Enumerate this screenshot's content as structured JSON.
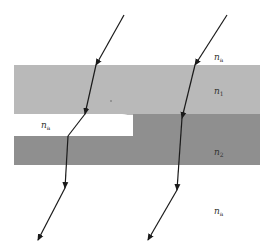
{
  "diagram": {
    "type": "optical-refraction-layers",
    "background": "#ffffff",
    "layers": [
      {
        "name": "layer-n1",
        "label": "n",
        "subscript": "1",
        "color": "#b9b9b9",
        "x": 14,
        "y": 65,
        "width": 246,
        "height": 49
      },
      {
        "name": "layer-n2",
        "label": "n",
        "subscript": "2",
        "color": "#8f8f8f",
        "x": 14,
        "y": 114,
        "width": 246,
        "height": 51
      }
    ],
    "gap": {
      "label": "n",
      "subscript": "a",
      "color": "#ffffff",
      "x": 14,
      "y": 114,
      "width": 119,
      "height": 22,
      "corner_radius": 11
    },
    "media_labels": [
      {
        "name": "label-na-top",
        "text": "n",
        "sub": "a",
        "x": 215,
        "y": 59
      },
      {
        "name": "label-n1",
        "text": "n",
        "sub": "1",
        "x": 215,
        "y": 94
      },
      {
        "name": "label-na-gap",
        "text": "n",
        "sub": "a",
        "x": 42,
        "y": 128
      },
      {
        "name": "label-n2",
        "text": "n",
        "sub": "2",
        "x": 215,
        "y": 154
      },
      {
        "name": "label-na-bottom",
        "text": "n",
        "sub": "a",
        "x": 215,
        "y": 213
      }
    ],
    "rays": [
      {
        "name": "ray-left",
        "color": "#1a1a1a",
        "points": [
          [
            124,
            15
          ],
          [
            96,
            65
          ],
          [
            85,
            114
          ],
          [
            68,
            136
          ],
          [
            65,
            188
          ],
          [
            38,
            240
          ]
        ],
        "arrowheads": [
          [
            100,
            58,
            96,
            65
          ],
          [
            86,
            107,
            85,
            114
          ],
          [
            65,
            181,
            65,
            188
          ],
          [
            38,
            240,
            38,
            240
          ]
        ]
      },
      {
        "name": "ray-right",
        "color": "#1a1a1a",
        "points": [
          [
            227,
            15
          ],
          [
            195,
            65
          ],
          [
            183,
            118
          ],
          [
            177,
            190
          ],
          [
            148,
            240
          ]
        ],
        "arrowheads": [
          [
            199,
            58,
            195,
            65
          ],
          [
            184,
            111,
            183,
            118
          ],
          [
            177,
            183,
            177,
            190
          ],
          [
            148,
            240,
            148,
            240
          ]
        ]
      }
    ]
  }
}
